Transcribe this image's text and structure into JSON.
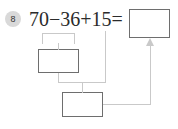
{
  "problem": {
    "number": "8",
    "expression": "70−36+15=",
    "operands": [
      70,
      36,
      15
    ],
    "operators": [
      "−",
      "+"
    ],
    "equals_sign": "="
  },
  "boxes": {
    "answer": {
      "label": "answer-box",
      "value": ""
    },
    "step_one": {
      "label": "first-step-box",
      "value": ""
    },
    "step_two": {
      "label": "second-step-box",
      "value": ""
    }
  },
  "colors": {
    "box_border": "#6e6e6e",
    "connector": "#c9c9c9",
    "badge_bg": "#d9d9d9",
    "text": "#2b2b2b",
    "page_bg": "#ffffff"
  }
}
